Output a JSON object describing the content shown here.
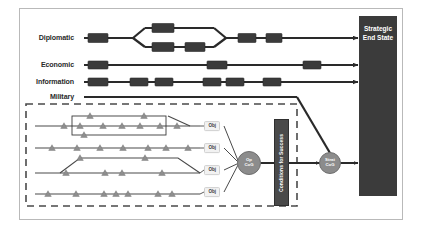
{
  "diagram": {
    "colors": {
      "node_fill": "#3b3b3b",
      "end_state_fill": "#3b3b3b",
      "cog_fill": "#8c8c8c",
      "conditions_fill": "#4a4a4a",
      "triangle_fill": "#8e8e8e",
      "line": "#2a2a2a",
      "military_box_border": "#4a4a4a",
      "frame_border": "#b9b9b9",
      "obj_fill": "#f2f2f2"
    },
    "lines_of_effort": [
      {
        "label": "Diplomatic",
        "label_x": 74,
        "label_y": 38,
        "y": 38,
        "start_x": 84,
        "end_x": 358,
        "nodes": [
          {
            "x": 88,
            "y": 38,
            "w": 20,
            "h": 9
          },
          {
            "x": 152,
            "y": 28,
            "w": 22,
            "h": 9
          },
          {
            "x": 152,
            "y": 47,
            "w": 22,
            "h": 9
          },
          {
            "x": 185,
            "y": 47,
            "w": 20,
            "h": 9
          },
          {
            "x": 238,
            "y": 38,
            "w": 18,
            "h": 9
          },
          {
            "x": 266,
            "y": 38,
            "w": 16,
            "h": 9
          }
        ],
        "branch": {
          "split_x": 133,
          "merge_x": 226,
          "upper_y": 28,
          "lower_y": 47
        }
      },
      {
        "label": "Economic",
        "label_x": 74,
        "label_y": 65,
        "y": 65,
        "start_x": 84,
        "end_x": 358,
        "nodes": [
          {
            "x": 88,
            "y": 65,
            "w": 20,
            "h": 8
          },
          {
            "x": 207,
            "y": 65,
            "w": 20,
            "h": 8
          },
          {
            "x": 303,
            "y": 65,
            "w": 18,
            "h": 8
          }
        ],
        "branch": null
      },
      {
        "label": "Information",
        "label_x": 74,
        "label_y": 82,
        "y": 82,
        "start_x": 84,
        "end_x": 358,
        "nodes": [
          {
            "x": 88,
            "y": 82,
            "w": 20,
            "h": 8
          },
          {
            "x": 130,
            "y": 82,
            "w": 18,
            "h": 8
          },
          {
            "x": 155,
            "y": 82,
            "w": 18,
            "h": 8
          },
          {
            "x": 203,
            "y": 82,
            "w": 18,
            "h": 8
          },
          {
            "x": 226,
            "y": 82,
            "w": 18,
            "h": 8
          },
          {
            "x": 263,
            "y": 82,
            "w": 18,
            "h": 8
          }
        ],
        "branch": null
      },
      {
        "label": "Military",
        "label_x": 74,
        "label_y": 97,
        "y": 97,
        "start_x": 84,
        "end_x": 297,
        "nodes": [],
        "branch": null
      }
    ],
    "military_box": {
      "x": 26,
      "y": 104,
      "w": 271,
      "h": 102,
      "style": "dashed"
    },
    "swimlanes": [
      {
        "y": 126,
        "start_x": 35,
        "end_x": 200,
        "tasks_x": [
          64,
          80,
          103,
          122,
          140,
          160,
          177
        ],
        "branch": {
          "type": "loop",
          "box": {
            "x": 72,
            "y": 116,
            "w": 94,
            "h": 19
          },
          "upper_tasks_x": [
            90,
            144
          ],
          "lower_tasks_x": [
            84
          ]
        },
        "exit_bend": {
          "from_x": 168,
          "to_x": 190
        }
      },
      {
        "y": 148,
        "start_x": 35,
        "end_x": 200,
        "tasks_x": [
          52,
          77,
          100,
          123,
          148,
          166,
          188
        ],
        "branch": null,
        "exit_bend": null
      },
      {
        "y": 173,
        "start_x": 35,
        "end_x": 200,
        "tasks_x": [
          66,
          105,
          122,
          162
        ],
        "branch": {
          "type": "arc",
          "top_y": 158,
          "rise_x": 60,
          "plateau_start_x": 80,
          "plateau_end_x": 178,
          "fall_x": 200,
          "top_tasks_x": [
            80,
            145
          ]
        },
        "exit_bend": null
      },
      {
        "y": 194,
        "start_x": 35,
        "end_x": 200,
        "tasks_x": [
          48,
          76,
          104,
          116,
          128,
          158,
          172
        ],
        "branch": null,
        "exit_bend": null
      }
    ],
    "objectives": [
      {
        "label": "Obj",
        "x": 208,
        "y": 126
      },
      {
        "label": "Obj",
        "x": 208,
        "y": 148
      },
      {
        "label": "Obj",
        "x": 208,
        "y": 170
      },
      {
        "label": "Obj",
        "x": 208,
        "y": 192
      }
    ],
    "op_cog": {
      "line1": "Op",
      "line2": "CoG",
      "x": 249,
      "y": 163,
      "d": 22
    },
    "conditions_for_success": {
      "label": "Conditions for Success",
      "x": 274,
      "y": 119,
      "w": 15,
      "h": 87
    },
    "strat_cog": {
      "line1": "Strat",
      "line2": "CoG",
      "x": 330,
      "y": 163,
      "d": 20
    },
    "strategic_end_state": {
      "line1": "Strategic",
      "line2": "End State",
      "x": 359,
      "y": 16,
      "w": 38,
      "h": 180
    },
    "connectors": [
      {
        "name": "military-to-strat-cog",
        "from_x": 297,
        "from_y": 97,
        "to_x": 330,
        "to_y": 153
      },
      {
        "name": "op-cog-to-conditions",
        "from_x": 260,
        "from_y": 163,
        "to_x": 274,
        "to_y": 163
      },
      {
        "name": "conditions-to-strat-cog",
        "from_x": 289,
        "from_y": 163,
        "to_x": 320,
        "to_y": 163
      },
      {
        "name": "strat-cog-to-end-state",
        "from_x": 340,
        "from_y": 163,
        "to_x": 358,
        "to_y": 163
      }
    ]
  }
}
